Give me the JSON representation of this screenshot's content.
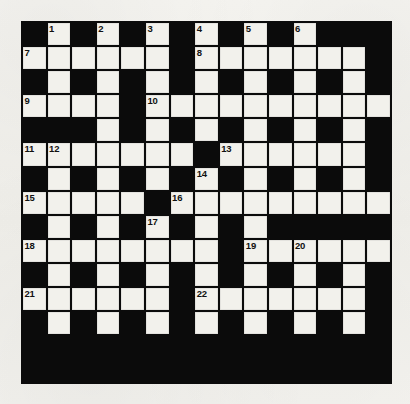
{
  "puzzle": {
    "title": "Crossword Grid",
    "type": "crossword",
    "rows": 15,
    "columns": 15,
    "colors": {
      "block": "#0b0b0b",
      "light": "#f2f1ec",
      "paper": "#f3f2ee",
      "number_text": "#111111"
    },
    "cell_legend": {
      "B": "black-block-cell",
      "W": "white-answer-cell"
    },
    "grid": [
      "BWBWBWBWBWBWBBB",
      "WWWWWWBWWWWWWWB",
      "BWBWBWBWBWBWBWB",
      "WWWWBWWWWWWWWWW",
      "BBBWBWBWBWBWBWB",
      "WWWWWWWBWWWWWWB",
      "BWBWBWBWBWBWBWB",
      "WWWWWBWWWWWWWWW",
      "BWBWBWBWBWBBBBB",
      "WWWWWWWWBWWWWWW",
      "BWBWBWBWBWBWBWB",
      "WWWWWWBWWWWWWWB",
      "BWBWBWBWBWBWBWB",
      "BBBBBBBBBBBBBBB",
      "BBBBBBBBBBBBBBB"
    ],
    "numbers": [
      {
        "n": "1",
        "row": 0,
        "col": 1
      },
      {
        "n": "2",
        "row": 0,
        "col": 3
      },
      {
        "n": "3",
        "row": 0,
        "col": 5
      },
      {
        "n": "4",
        "row": 0,
        "col": 7
      },
      {
        "n": "5",
        "row": 0,
        "col": 9
      },
      {
        "n": "6",
        "row": 0,
        "col": 11
      },
      {
        "n": "7",
        "row": 1,
        "col": 0
      },
      {
        "n": "8",
        "row": 1,
        "col": 7
      },
      {
        "n": "9",
        "row": 3,
        "col": 0
      },
      {
        "n": "10",
        "row": 3,
        "col": 5
      },
      {
        "n": "11",
        "row": 5,
        "col": 0
      },
      {
        "n": "12",
        "row": 5,
        "col": 1
      },
      {
        "n": "13",
        "row": 5,
        "col": 8
      },
      {
        "n": "14",
        "row": 6,
        "col": 7
      },
      {
        "n": "15",
        "row": 7,
        "col": 0
      },
      {
        "n": "16",
        "row": 7,
        "col": 6
      },
      {
        "n": "17",
        "row": 8,
        "col": 5
      },
      {
        "n": "18",
        "row": 9,
        "col": 0
      },
      {
        "n": "19",
        "row": 9,
        "col": 9
      },
      {
        "n": "20",
        "row": 9,
        "col": 11
      },
      {
        "n": "21",
        "row": 11,
        "col": 0
      },
      {
        "n": "22",
        "row": 11,
        "col": 7
      }
    ],
    "entry_count": 22
  }
}
